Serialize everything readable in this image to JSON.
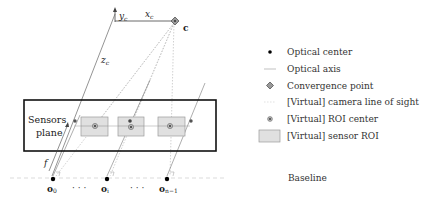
{
  "diagram": {
    "axes": {
      "y_label": "y",
      "y_sub": "c",
      "x_label": "x",
      "x_sub": "c",
      "z_label": "z",
      "z_sub": "c",
      "convergence_label": "c"
    },
    "sensor_box": {
      "label_line1": "Sensors",
      "label_line2": "plane"
    },
    "focal_label": "f",
    "baseline_label": "Baseline",
    "optical_centers": [
      {
        "label": "o",
        "sub": "0"
      },
      {
        "label": "o",
        "sub": "i"
      },
      {
        "label": "o",
        "sub": "n−1"
      }
    ],
    "ellipsis": "· · ·",
    "legend": [
      {
        "icon": "optical-center-dot-icon",
        "label": "Optical center"
      },
      {
        "icon": "optical-axis-line-icon",
        "label": "Optical axis"
      },
      {
        "icon": "convergence-diamond-icon",
        "label": "Convergence point"
      },
      {
        "icon": "line-of-sight-dotted-icon",
        "label": "[Virtual] camera line of sight"
      },
      {
        "icon": "roi-center-icon",
        "label": "[Virtual] ROI center"
      },
      {
        "icon": "sensor-roi-rect-icon",
        "label": "[Virtual] sensor ROI"
      }
    ],
    "colors": {
      "roi_fill": "#e0e0e0",
      "roi_stroke": "#9a9a9a",
      "line_of_sight": "#b8b8b8",
      "axis": "#555555",
      "box": "#111111"
    }
  }
}
